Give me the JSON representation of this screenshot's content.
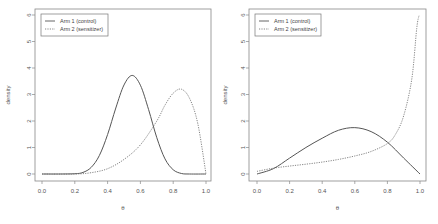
{
  "chart_data": [
    {
      "type": "line",
      "title": "",
      "xlabel": "θ",
      "ylabel": "density",
      "xlim": [
        0,
        1
      ],
      "ylim": [
        0,
        6
      ],
      "xticks": [
        "0.0",
        "0.2",
        "0.4",
        "0.6",
        "0.8",
        "1.0"
      ],
      "yticks": [
        "0",
        "1",
        "2",
        "3",
        "4",
        "5",
        "6"
      ],
      "legend_position": "top-left",
      "series": [
        {
          "name": "Arm 1 (control)",
          "style": "solid",
          "x": [
            0,
            0.1,
            0.2,
            0.25,
            0.3,
            0.35,
            0.4,
            0.45,
            0.5,
            0.55,
            0.6,
            0.65,
            0.7,
            0.75,
            0.8,
            0.85,
            0.9,
            1.0
          ],
          "y": [
            0,
            0,
            0.01,
            0.06,
            0.25,
            0.7,
            1.49,
            2.49,
            3.36,
            3.72,
            3.35,
            2.43,
            1.37,
            0.57,
            0.16,
            0.02,
            0,
            0
          ]
        },
        {
          "name": "Arm 2 (sensitizer)",
          "style": "dashed",
          "x": [
            0,
            0.2,
            0.3,
            0.4,
            0.5,
            0.6,
            0.7,
            0.75,
            0.8,
            0.85,
            0.9,
            0.95,
            1.0
          ],
          "y": [
            0,
            0,
            0.05,
            0.2,
            0.55,
            1.1,
            2.0,
            2.6,
            3.05,
            3.2,
            2.85,
            1.9,
            0
          ]
        }
      ]
    },
    {
      "type": "line",
      "title": "",
      "xlabel": "θ",
      "ylabel": "density",
      "xlim": [
        0,
        1
      ],
      "ylim": [
        0,
        6
      ],
      "xticks": [
        "0.0",
        "0.2",
        "0.4",
        "0.6",
        "0.8",
        "1.0"
      ],
      "yticks": [
        "0",
        "1",
        "2",
        "3",
        "4",
        "5",
        "6"
      ],
      "legend_position": "top-left",
      "series": [
        {
          "name": "Arm 1 (control)",
          "style": "solid",
          "x": [
            0,
            0.1,
            0.2,
            0.3,
            0.4,
            0.5,
            0.6,
            0.7,
            0.8,
            0.9,
            1.0
          ],
          "y": [
            0,
            0.2,
            0.6,
            1.0,
            1.35,
            1.65,
            1.75,
            1.6,
            1.2,
            0.6,
            0
          ]
        },
        {
          "name": "Arm 2 (sensitizer)",
          "style": "dashed",
          "x": [
            0,
            0.1,
            0.2,
            0.3,
            0.4,
            0.5,
            0.6,
            0.7,
            0.8,
            0.85,
            0.9,
            0.95,
            0.98,
            0.995
          ],
          "y": [
            0.1,
            0.22,
            0.3,
            0.37,
            0.45,
            0.55,
            0.68,
            0.85,
            1.15,
            1.5,
            2.2,
            3.6,
            5.5,
            6.0
          ]
        }
      ]
    }
  ]
}
